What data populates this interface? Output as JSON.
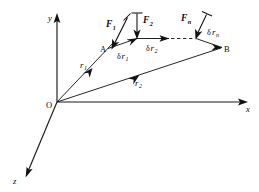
{
  "figure": {
    "background_color": "#ffffff",
    "ink_color": "#111111"
  },
  "axes": {
    "y": {
      "label": "y",
      "from": [
        57,
        102
      ],
      "to": [
        57,
        18
      ]
    },
    "x": {
      "label": "x",
      "from": [
        57,
        102
      ],
      "to": [
        243,
        102
      ]
    },
    "z": {
      "label": "z",
      "from": [
        57,
        102
      ],
      "to": [
        26,
        176
      ]
    }
  },
  "points": {
    "origin": {
      "label": "O",
      "x": 57,
      "y": 102
    },
    "a": {
      "label": "A",
      "x": 108,
      "y": 48
    },
    "b": {
      "label": "B",
      "x": 222,
      "y": 48
    }
  },
  "position_vectors": [
    {
      "label": "r",
      "subscript": "1",
      "from": [
        57,
        102
      ],
      "to": [
        112,
        44
      ],
      "label_x": 84,
      "label_y": 66
    },
    {
      "label": "r",
      "subscript": "2",
      "from": [
        57,
        102
      ],
      "to": [
        220,
        48
      ],
      "label_x": 139,
      "label_y": 85
    }
  ],
  "forces": [
    {
      "label": "F",
      "subscript": "1",
      "tail": [
        128,
        17
      ],
      "head": [
        112,
        47
      ],
      "label_x": 111,
      "label_y": 25
    },
    {
      "label": "F",
      "subscript": "2",
      "tail": [
        137,
        12
      ],
      "head": [
        137,
        38
      ],
      "label_x": 142,
      "label_y": 21
    },
    {
      "label": "F",
      "subscript": "n",
      "tail": [
        206,
        15
      ],
      "head": [
        196,
        38
      ],
      "label_x": 185,
      "label_y": 19
    }
  ],
  "virtual_displacements": [
    {
      "prefix": "δ",
      "label": "r",
      "subscript": "1",
      "tail": [
        110,
        48
      ],
      "head": [
        136,
        39
      ],
      "label_x": 122,
      "label_y": 57
    },
    {
      "prefix": "δ",
      "label": "r",
      "subscript": "2",
      "tail": [
        138,
        38
      ],
      "head": [
        166,
        38
      ],
      "label_x": 150,
      "label_y": 49
    },
    {
      "prefix": "δ",
      "label": "r",
      "subscript": "n",
      "tail": [
        196,
        38
      ],
      "head": [
        219,
        45
      ],
      "label_x": 205,
      "label_y": 35
    }
  ],
  "dashed_segment": {
    "from": [
      146,
      38
    ],
    "to": [
      195,
      38
    ]
  },
  "path_segments": [
    {
      "from": [
        108,
        48
      ],
      "to": [
        137,
        38
      ]
    },
    {
      "from": [
        137,
        38
      ],
      "to": [
        168,
        38
      ]
    },
    {
      "from": [
        196,
        38
      ],
      "to": [
        222,
        47
      ]
    }
  ]
}
